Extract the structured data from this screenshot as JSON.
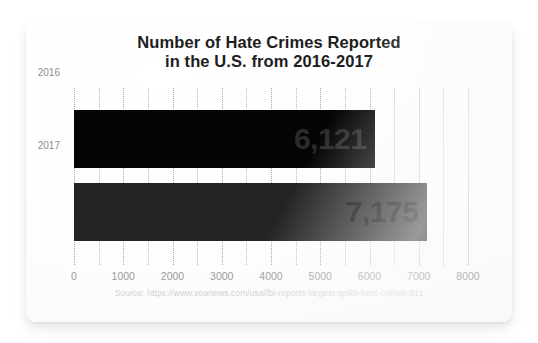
{
  "card": {
    "source_note": "Source: https://www.voanews.com/usa/fbi-reports-largest-spike-hate-crimes-911"
  },
  "chart_data": {
    "type": "bar",
    "orientation": "horizontal",
    "title": "Number of Hate Crimes Reported in the U.S. from 2016-2017",
    "title_line1": "Number of Hate Crimes Reported",
    "title_line2": "in the U.S. from 2016-2017",
    "categories": [
      "2016",
      "2017"
    ],
    "values": [
      6121,
      7175
    ],
    "value_labels": [
      "6,121",
      "7,175"
    ],
    "bar_colors": [
      "#050505",
      "#242424"
    ],
    "xlabel": "",
    "ylabel": "",
    "xlim": [
      0,
      8000
    ],
    "xticks": [
      0,
      1000,
      2000,
      3000,
      4000,
      5000,
      6000,
      7000,
      8000
    ],
    "xtick_labels": [
      "0",
      "1000",
      "2000",
      "3000",
      "4000",
      "5000",
      "6000",
      "7000",
      "8000"
    ],
    "minor_gridline_step": 500,
    "grid": true,
    "grid_style": "dotted-vertical",
    "legend": "none"
  }
}
